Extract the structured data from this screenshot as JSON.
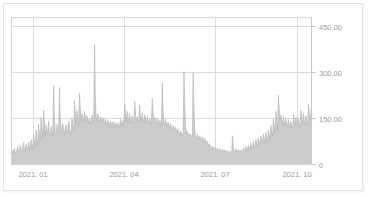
{
  "chart_data": {
    "type": "area",
    "title": "",
    "subtitle": "",
    "xlabel": "",
    "ylabel": "",
    "grid": true,
    "legend": "none",
    "ylim": [
      0,
      480
    ],
    "y_ticks": [
      0,
      150,
      300,
      450
    ],
    "y_tick_labels": [
      "0",
      "150.00",
      "300.00",
      "450.00"
    ],
    "x_tick_labels": [
      "2021. 01",
      "2021. 04",
      "2021. 07",
      "2021. 10"
    ],
    "x_tick_positions": [
      22,
      113,
      204,
      286
    ],
    "x_range_label": "2020.12 - 2021.12",
    "series_name": "",
    "series_color": "#c9c9c9",
    "n_points": 360,
    "values": [
      38,
      30,
      44,
      34,
      52,
      40,
      33,
      46,
      58,
      41,
      35,
      62,
      48,
      39,
      55,
      70,
      50,
      42,
      66,
      54,
      45,
      72,
      58,
      47,
      80,
      62,
      52,
      95,
      74,
      58,
      110,
      85,
      64,
      130,
      98,
      72,
      152,
      115,
      82,
      175,
      130,
      90,
      128,
      96,
      110,
      140,
      100,
      86,
      122,
      105,
      92,
      255,
      148,
      104,
      96,
      130,
      112,
      98,
      250,
      140,
      106,
      120,
      132,
      108,
      96,
      118,
      128,
      100,
      112,
      140,
      118,
      104,
      96,
      150,
      126,
      108,
      208,
      160,
      132,
      175,
      148,
      124,
      232,
      178,
      145,
      165,
      150,
      138,
      172,
      155,
      140,
      158,
      146,
      132,
      150,
      138,
      128,
      160,
      144,
      136,
      390,
      210,
      152,
      140,
      165,
      148,
      138,
      155,
      146,
      134,
      150,
      142,
      130,
      148,
      138,
      128,
      142,
      135,
      126,
      140,
      132,
      124,
      138,
      130,
      122,
      136,
      128,
      120,
      134,
      126,
      118,
      148,
      134,
      125,
      142,
      130,
      196,
      160,
      138,
      172,
      150,
      135,
      165,
      145,
      132,
      158,
      142,
      130,
      205,
      162,
      140,
      155,
      144,
      134,
      192,
      158,
      140,
      168,
      148,
      136,
      160,
      145,
      133,
      155,
      142,
      130,
      148,
      138,
      128,
      215,
      168,
      145,
      152,
      140,
      130,
      148,
      136,
      126,
      144,
      134,
      124,
      265,
      175,
      140,
      128,
      145,
      132,
      122,
      138,
      128,
      118,
      132,
      122,
      112,
      126,
      116,
      108,
      120,
      110,
      102,
      114,
      104,
      96,
      108,
      100,
      92,
      104,
      302,
      185,
      122,
      98,
      108,
      96,
      88,
      100,
      92,
      84,
      96,
      298,
      180,
      112,
      92,
      84,
      96,
      88,
      80,
      92,
      84,
      76,
      88,
      80,
      72,
      84,
      76,
      68,
      74,
      66,
      58,
      64,
      56,
      50,
      58,
      52,
      46,
      54,
      48,
      44,
      52,
      46,
      42,
      50,
      45,
      40,
      48,
      44,
      40,
      46,
      42,
      38,
      44,
      40,
      36,
      42,
      38,
      35,
      92,
      58,
      42,
      38,
      50,
      44,
      38,
      48,
      42,
      38,
      46,
      42,
      38,
      52,
      46,
      40,
      58,
      50,
      44,
      62,
      54,
      46,
      68,
      58,
      50,
      74,
      62,
      54,
      80,
      68,
      58,
      86,
      72,
      62,
      92,
      78,
      66,
      98,
      82,
      70,
      104,
      88,
      74,
      112,
      95,
      80,
      126,
      105,
      88,
      148,
      122,
      100,
      172,
      140,
      112,
      225,
      175,
      138,
      160,
      142,
      128,
      155,
      138,
      125,
      150,
      134,
      122,
      145,
      130,
      118,
      140,
      126,
      115,
      162,
      140,
      125,
      152,
      135,
      122,
      148,
      132,
      120,
      175,
      148,
      130,
      165,
      142,
      128,
      158,
      138,
      126,
      196,
      162,
      140,
      180
    ]
  }
}
